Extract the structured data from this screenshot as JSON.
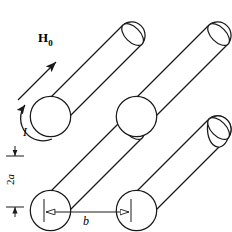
{
  "figure": {
    "stroke_color": "#1a1a1a",
    "fill_color": "#ffffff",
    "background": "#ffffff",
    "labels": {
      "field": "H",
      "field_subscript": "0",
      "field_full": "H0",
      "current": "I",
      "diameter": "2a",
      "diameter_prefix": "2",
      "diameter_symbol": "a",
      "spacing": "b"
    },
    "icons": {
      "field_arrow": "arrow-up-right-solid-icon",
      "current_arrow": "circular-arrow-counterclockwise-icon",
      "diameter_arrows": "double-headed-arrow-vertical-icon",
      "spacing_arrows": "double-headed-arrow-horizontal-open-icon"
    },
    "geometry": {
      "cylinder_count": 4,
      "rows": 2,
      "columns": 2,
      "tilt_description": "cylinders inclined up and to the right",
      "near_end": "circle",
      "far_end": "ellipse"
    }
  }
}
